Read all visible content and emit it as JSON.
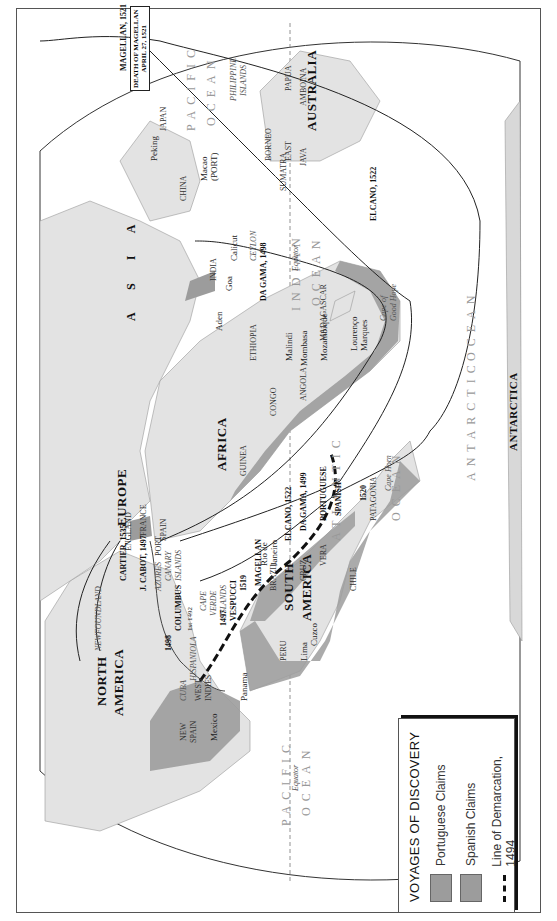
{
  "legend": {
    "title": "VOYAGES OF DISCOVERY",
    "items": [
      {
        "label": "Portuguese Claims",
        "symbol": "gray-swatch",
        "color": "#9c9c9c"
      },
      {
        "label": "Spanish Claims",
        "symbol": "gray-swatch",
        "color": "#9c9c9c"
      },
      {
        "label": "Line of Demarcation, 1494",
        "symbol": "dashed-line",
        "color": "#111111"
      }
    ]
  },
  "continents": {
    "asia": "A S I A",
    "europe": "EUROPE",
    "africa": "AFRICA",
    "australia": "AUSTRALIA",
    "north_america": "NORTH AMERICA",
    "north": "NORTH",
    "america_n": "AMERICA",
    "south": "SOUTH",
    "america_s": "AMERICA",
    "antarctica": "ANTARCTICA"
  },
  "oceans": {
    "pacific_east_1": "PACIFIC",
    "pacific_east_2": "OCEAN",
    "pacific_west_1": "PACIFIC",
    "pacific_west_2": "OCEAN",
    "indian_1": "INDIAN",
    "indian_2": "OCEAN",
    "atlantic_1": "ATLANTIC",
    "atlantic_2": "OCEAN",
    "antarctic_1": "ANTARCTIC",
    "antarctic_2": "OCEAN"
  },
  "regions": {
    "japan": "JAPAN",
    "china": "CHINA",
    "india": "INDIA",
    "ceylon": "CEYLON",
    "sumatra": "SUMATRA",
    "borneo": "BORNEO",
    "east": "EAST",
    "java": "JAVA",
    "philippine": "PHILIPPINE",
    "islands_ph": "ISLANDS",
    "papua": "PAPUA",
    "amboina": "AMBOINA",
    "madagascar": "MADAGASCAR",
    "ethiopia": "ETHIOPIA",
    "congo": "CONGO",
    "angola": "ANGOLA",
    "guinea": "GUINEA",
    "spain": "SPAIN",
    "port": "PORT",
    "france": "FRANCE",
    "england": "ENGLAND",
    "newfoundland": "NEWFOUNDLAND",
    "azores": "AZORES",
    "canary": "CANARY",
    "islands_can": "ISLANDS",
    "cape": "CAPE",
    "verde": "VERDE",
    "islands_cv": "ISLANDS",
    "hispaniola": "HISPANIOLA",
    "cuba": "CUBA",
    "west": "WEST",
    "indies": "INDIES",
    "new": "NEW",
    "spain_ns": "SPAIN",
    "peru": "PERU",
    "brazil": "BRAZIL",
    "vera": "VERA",
    "cruz": "CRUZ",
    "chile": "CHILE",
    "patagonia": "PATAGONIA",
    "portuguese": "PORTUGUESE",
    "spanish": "SPANISH",
    "cape_horn": "Cape Horn",
    "cape_good_hope_1": "Cape of",
    "cape_good_hope_2": "Good Hope",
    "equator_1": "Equator",
    "equator_2": "Equator",
    "equator_3": "Equator"
  },
  "cities": {
    "peking": "Peking",
    "macao": "Macao",
    "macao_port": "(PORT)",
    "goa": "Goa",
    "calicut": "Calicut",
    "aden": "Aden",
    "malindi": "Malindi",
    "mombasa": "Mombasa",
    "mozambique": "Mozambique",
    "lourenco_1": "Lourenço",
    "lourenco_2": "Marques",
    "mexico": "Mexico",
    "panama": "Panama",
    "lima": "Lima",
    "cuzco": "Cuzco",
    "rio_1": "Rio de",
    "rio_2": "Janeiro"
  },
  "routes": {
    "magellan_1521_pacific": "MAGELLAN, 1521",
    "magellan_1521_east": "MAGELLAN, 1521",
    "magellan_1519": "1519",
    "magellan_label": "MAGELLAN",
    "magellan_1520": "1520",
    "elcano_1522_indian": "ELCANO, 1522",
    "elcano_1522_atlantic": "ELCANO, 1522",
    "dagama_1499": "DA GAMA, 1499",
    "dagama_1498": "DA GAMA, 1498",
    "vespucci": "VESPUCCI",
    "vespucci_year": "1497",
    "cabot": "J. CABOT, 1497",
    "cartier": "CARTIER, 1535",
    "columbus": "COLUMBUS",
    "columbus_year": "1st 1492",
    "route_1498": "1498"
  },
  "annotations": {
    "death_of_magellan_1": "DEATH OF MAGELLAN",
    "death_of_magellan_2": "APRIL 27, 1521"
  },
  "colors": {
    "land": "#e3e3e3",
    "claims": "#9c9c9c",
    "route": "#222222",
    "ocean_text": "#999999"
  }
}
